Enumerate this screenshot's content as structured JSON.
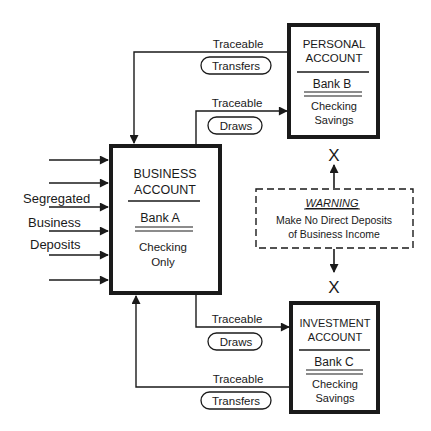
{
  "business_account": {
    "title_line1": "BUSINESS",
    "title_line2": "ACCOUNT",
    "bank": "Bank A",
    "type_line1": "Checking",
    "type_line2": "Only"
  },
  "personal_account": {
    "title_line1": "PERSONAL",
    "title_line2": "ACCOUNT",
    "bank": "Bank B",
    "type_line1": "Checking",
    "type_line2": "Savings"
  },
  "investment_account": {
    "title_line1": "INVESTMENT",
    "title_line2": "ACCOUNT",
    "bank": "Bank C",
    "type_line1": "Checking",
    "type_line2": "Savings"
  },
  "deposits_label": {
    "line1": "Segregated",
    "line2": "Business",
    "line3": "Deposits"
  },
  "flows": {
    "personal_transfers": {
      "label": "Traceable",
      "badge": "Transfers"
    },
    "personal_draws": {
      "label": "Traceable",
      "badge": "Draws"
    },
    "investment_draws": {
      "label": "Traceable",
      "badge": "Draws"
    },
    "investment_transfers": {
      "label": "Traceable",
      "badge": "Transfers"
    }
  },
  "warning": {
    "title": "WARNING",
    "line1": "Make No Direct Deposits",
    "line2": "of Business Income"
  },
  "blocked_marks": {
    "top": "X",
    "bottom": "X"
  }
}
